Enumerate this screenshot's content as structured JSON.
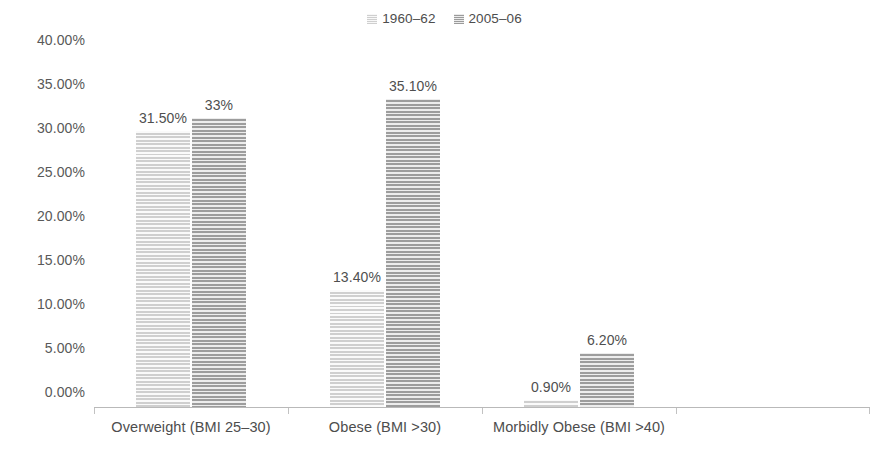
{
  "chart_data": {
    "type": "bar",
    "title": "",
    "subtitle": "",
    "xlabel": "",
    "ylabel": "",
    "grid": false,
    "legend_position": "top-center",
    "categories": [
      "Overweight (BMI 25–30)",
      "Obese (BMI >30)",
      "Morbidly Obese (BMI >40)",
      ""
    ],
    "series": [
      {
        "name": "1960–62",
        "color": "#cfcfcf",
        "values": [
          31.5,
          13.4,
          0.9,
          null
        ],
        "labels": [
          "31.50%",
          "13.40%",
          "0.90%",
          ""
        ]
      },
      {
        "name": "2005–06",
        "color": "#9d9d9d",
        "values": [
          33,
          35.1,
          6.2,
          null
        ],
        "labels": [
          "33%",
          "35.10%",
          "6.20%",
          ""
        ]
      }
    ],
    "ylim": [
      0,
      40
    ],
    "ytick_values": [
      0,
      5,
      10,
      15,
      20,
      25,
      30,
      35,
      40
    ],
    "ytick_labels": [
      "0.00%",
      "5.00%",
      "10.00%",
      "15.00%",
      "20.00%",
      "25.00%",
      "30.00%",
      "35.00%",
      "40.00%"
    ]
  }
}
